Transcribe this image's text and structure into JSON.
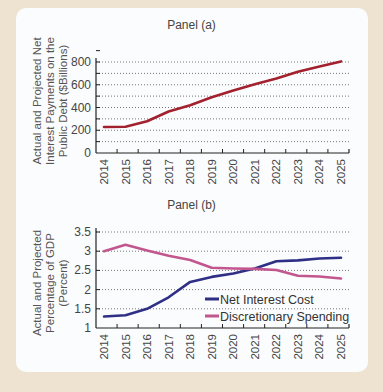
{
  "panels": {
    "a_title": "Panel (a)",
    "a_ylabel": [
      "Actual and Projected Net",
      "Interest Payments on the",
      "Public Debt ($Billions)"
    ],
    "b_title": "Panel (b)",
    "b_ylabel": [
      "Actual and Projected",
      "Percentage of GDP",
      "(Percent)"
    ]
  },
  "chart_data": [
    {
      "type": "line",
      "title": "Panel (a)",
      "xlabel": "",
      "ylabel": "Actual and Projected Net Interest Payments on the Public Debt ($Billions)",
      "x": [
        "2014",
        "2015",
        "2016",
        "2017",
        "2018",
        "2019",
        "2020",
        "2021",
        "2022",
        "2023",
        "2024",
        "2025"
      ],
      "series": [
        {
          "name": "Net Interest Payments",
          "color": "#a3202e",
          "values": [
            229,
            230,
            280,
            365,
            420,
            490,
            550,
            605,
            655,
            715,
            760,
            805
          ]
        }
      ],
      "ylim": [
        0,
        900
      ],
      "yticks": [
        0,
        200,
        400,
        600,
        800
      ],
      "grid": "horizontal dotted",
      "legend": null
    },
    {
      "type": "line",
      "title": "Panel (b)",
      "xlabel": "",
      "ylabel": "Actual and Projected Percentage of GDP (Percent)",
      "x": [
        "2014",
        "2015",
        "2016",
        "2017",
        "2018",
        "2019",
        "2020",
        "2021",
        "2022",
        "2023",
        "2024",
        "2025"
      ],
      "series": [
        {
          "name": "Net Interest Cost",
          "color": "#2f2f86",
          "values": [
            1.3,
            1.33,
            1.5,
            1.8,
            2.2,
            2.33,
            2.42,
            2.55,
            2.74,
            2.76,
            2.81,
            2.83
          ]
        },
        {
          "name": "Discretionary Spending",
          "color": "#c2578f",
          "values": [
            3.0,
            3.17,
            3.02,
            2.88,
            2.77,
            2.57,
            2.55,
            2.54,
            2.51,
            2.36,
            2.34,
            2.29
          ]
        }
      ],
      "ylim": [
        1,
        3.5
      ],
      "yticks": [
        "1",
        "1.5",
        "2",
        "2.5",
        "3",
        "3.5"
      ],
      "grid": "horizontal dotted",
      "legend": "lower right inside plot"
    }
  ]
}
